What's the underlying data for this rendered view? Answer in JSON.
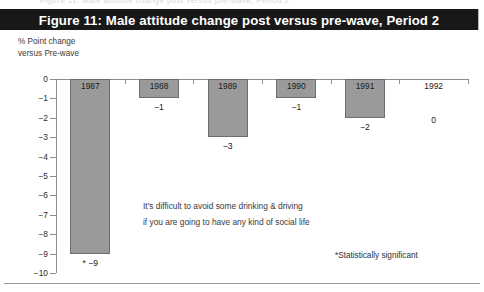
{
  "figure": {
    "title": "Figure 11: Male attitude change post versus pre-wave, Period 2",
    "axis_caption_line1": "% Point change",
    "axis_caption_line2": "versus Pre-wave",
    "annotation_line1": "It's difficult to avoid some drinking & driving",
    "annotation_line2": "if you are going to have any kind of social life",
    "footnote": "*Statistically significant",
    "scan_artifact_text": "Figure 11: Male attitude change post versus pre-wave, Period 2",
    "title_band_color": "#181818",
    "title_text_color": "#ffffff",
    "bar_fill_color": "#9a9a9a",
    "bar_border_color": "#6e6e6e",
    "axis_color": "#8d8d8d"
  },
  "chart_data": {
    "type": "bar",
    "title": "Figure 11: Male attitude change post versus pre-wave, Period 2",
    "xlabel": "",
    "ylabel": "% Point change versus Pre-wave",
    "ylim": [
      -10,
      0
    ],
    "grid": false,
    "legend": "none",
    "categories": [
      "1987",
      "1988",
      "1989",
      "1990",
      "1991",
      "1992"
    ],
    "values": [
      -9,
      -1,
      -3,
      -1,
      -2,
      0
    ],
    "data_labels": [
      "* −9",
      "−1",
      "−3",
      "−1",
      "−2",
      "0"
    ],
    "significant": [
      true,
      false,
      false,
      false,
      false,
      false
    ],
    "ytick_labels": [
      "0",
      "−1",
      "−2",
      "−3",
      "−4",
      "−5",
      "−6",
      "−7",
      "−8",
      "−9",
      "−10"
    ],
    "ytick_values": [
      0,
      -1,
      -2,
      -3,
      -4,
      -5,
      -6,
      -7,
      -8,
      -9,
      -10
    ],
    "annotations": [
      "It's difficult to avoid some drinking & driving",
      "if you are going to have any kind of social life"
    ],
    "footnote": "*Statistically significant"
  }
}
